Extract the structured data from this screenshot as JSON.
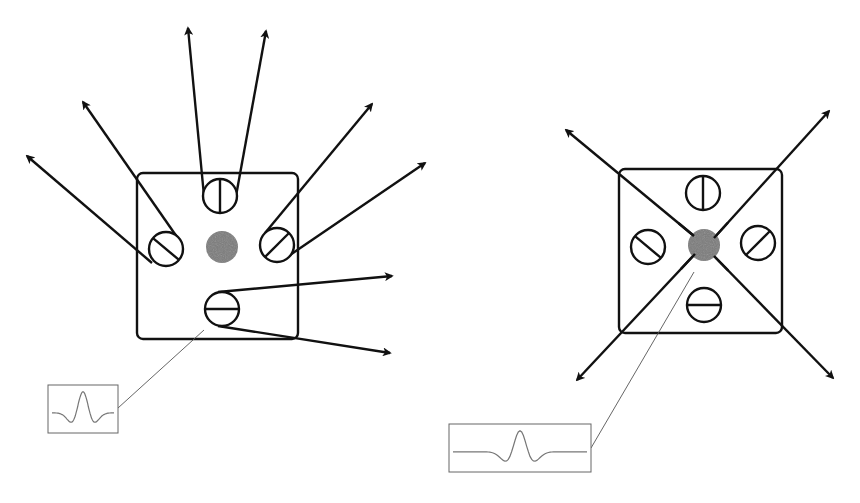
{
  "figure": {
    "panels": [
      {
        "id": "left",
        "description": "Square sensor with four surrounding oriented detectors, each emitting two arrows diverging outward; central gray spot; inset waveform",
        "box": {
          "x": 137,
          "y": 173,
          "w": 161,
          "h": 166
        },
        "center_spot": {
          "cx": 222,
          "cy": 247,
          "r": 16,
          "color": "#7a7a7a"
        },
        "detectors": [
          {
            "name": "top",
            "cx": 220,
            "cy": 196,
            "r": 17,
            "bar_angle_deg": 90
          },
          {
            "name": "left",
            "cx": 166,
            "cy": 249,
            "r": 17,
            "bar_angle_deg": 40
          },
          {
            "name": "right",
            "cx": 277,
            "cy": 245,
            "r": 17,
            "bar_angle_deg": -45
          },
          {
            "name": "bottom",
            "cx": 222,
            "cy": 309,
            "r": 17,
            "bar_angle_deg": 0
          }
        ],
        "arrows": [
          {
            "from": [
              204,
              196
            ],
            "to": [
              188,
              28
            ]
          },
          {
            "from": [
              236,
              196
            ],
            "to": [
              266,
              31
            ]
          },
          {
            "from": [
              152,
              263
            ],
            "to": [
              27,
              156
            ]
          },
          {
            "from": [
              177,
              237
            ],
            "to": [
              83,
              102
            ]
          },
          {
            "from": [
              265,
              233
            ],
            "to": [
              372,
              104
            ]
          },
          {
            "from": [
              290,
              255
            ],
            "to": [
              425,
              163
            ]
          },
          {
            "from": [
              218,
              292
            ],
            "to": [
              392,
              276
            ]
          },
          {
            "from": [
              218,
              326
            ],
            "to": [
              390,
              353
            ]
          }
        ],
        "inset": {
          "x": 48,
          "y": 385,
          "w": 70,
          "h": 48
        },
        "leader": {
          "from": [
            204,
            330
          ],
          "to": [
            118,
            408
          ]
        }
      },
      {
        "id": "right",
        "description": "Square sensor with four oriented detectors and diagonal arrows crossing through the central gray spot toward the four corners; inset waveform",
        "box": {
          "x": 619,
          "y": 169,
          "w": 163,
          "h": 164
        },
        "center_spot": {
          "cx": 704,
          "cy": 245,
          "r": 16,
          "color": "#7a7a7a"
        },
        "detectors": [
          {
            "name": "top",
            "cx": 703,
            "cy": 193,
            "r": 17,
            "bar_angle_deg": 90
          },
          {
            "name": "left",
            "cx": 648,
            "cy": 247,
            "r": 17,
            "bar_angle_deg": 40
          },
          {
            "name": "right",
            "cx": 758,
            "cy": 243,
            "r": 17,
            "bar_angle_deg": -45
          },
          {
            "name": "bottom",
            "cx": 704,
            "cy": 305,
            "r": 17,
            "bar_angle_deg": 0
          }
        ],
        "arrows": [
          {
            "from": [
              694,
              236
            ],
            "to": [
              566,
              130
            ]
          },
          {
            "from": [
              714,
              238
            ],
            "to": [
              829,
              111
            ]
          },
          {
            "from": [
              695,
              254
            ],
            "to": [
              577,
              380
            ]
          },
          {
            "from": [
              714,
              256
            ],
            "to": [
              833,
              378
            ]
          }
        ],
        "inset": {
          "x": 449,
          "y": 424,
          "w": 142,
          "h": 48
        },
        "leader": {
          "from": [
            694,
            272
          ],
          "to": [
            591,
            448
          ]
        }
      }
    ]
  }
}
